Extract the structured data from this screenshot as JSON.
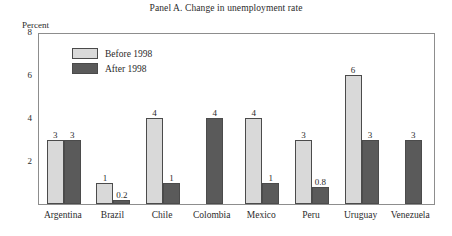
{
  "chart_data": {
    "type": "bar",
    "title": "Panel A. Change in unemployment rate",
    "xlabel": "",
    "ylabel": "Percent",
    "ylim": [
      0,
      8
    ],
    "yticks": [
      2,
      4,
      6,
      8
    ],
    "grid": false,
    "legend_position": "inside-top-left",
    "categories": [
      "Argentina",
      "Brazil",
      "Chile",
      "Colombia",
      "Mexico",
      "Peru",
      "Uruguay",
      "Venezuela"
    ],
    "series": [
      {
        "name": "Before 1998",
        "color": "#d9d9d9",
        "values": [
          3,
          1,
          4,
          null,
          4,
          3,
          6,
          null
        ],
        "labels": [
          "3",
          "1",
          "4",
          "",
          "4",
          "3",
          "6",
          ""
        ]
      },
      {
        "name": "After 1998",
        "color": "#5a5a5a",
        "values": [
          3,
          0.2,
          1,
          4,
          1,
          0.8,
          3,
          3
        ],
        "labels": [
          "3",
          "0.2",
          "1",
          "4",
          "1",
          "0.8",
          "3",
          "3"
        ]
      }
    ]
  },
  "axis": {
    "y_title": "Percent",
    "y_tick_labels": [
      "8",
      "6",
      "4",
      "2"
    ]
  },
  "legend": {
    "items": [
      {
        "label": "Before 1998",
        "color": "#d9d9d9"
      },
      {
        "label": "After 1998",
        "color": "#5a5a5a"
      }
    ]
  }
}
